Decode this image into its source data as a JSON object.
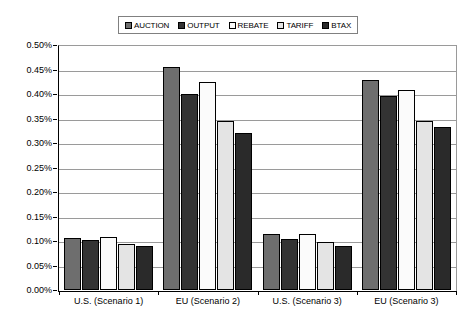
{
  "chart_data": {
    "type": "bar",
    "title": "",
    "xlabel": "",
    "ylabel": "",
    "ylim": [
      0,
      0.5
    ],
    "grid": true,
    "legend_position": "top-center",
    "categories": [
      "U.S. (Scenario 1)",
      "EU (Scenario 2)",
      "U.S. (Scenario 3)",
      "EU (Scenario 3)"
    ],
    "ytick_labels": [
      "0.50%",
      "0.45%",
      "0.40%",
      "0.35%",
      "0.30%",
      "0.25%",
      "0.20%",
      "0.15%",
      "0.10%",
      "0.05%",
      "0.00%"
    ],
    "ytick_values": [
      0.5,
      0.45,
      0.4,
      0.35,
      0.3,
      0.25,
      0.2,
      0.15,
      0.1,
      0.05,
      0.0
    ],
    "series": [
      {
        "name": "AUCTION",
        "color": "#6e6e6e",
        "values": [
          0.107,
          0.455,
          0.115,
          0.428
        ]
      },
      {
        "name": "OUTPUT",
        "color": "#333333",
        "values": [
          0.102,
          0.4,
          0.105,
          0.395
        ]
      },
      {
        "name": "REBATE",
        "color": "#fbfbfb",
        "values": [
          0.108,
          0.425,
          0.115,
          0.408
        ]
      },
      {
        "name": "TARIFF",
        "color": "#e4e4e4",
        "values": [
          0.094,
          0.345,
          0.098,
          0.345
        ]
      },
      {
        "name": "BTAX",
        "color": "#2a2a2a",
        "values": [
          0.089,
          0.32,
          0.09,
          0.333
        ]
      }
    ],
    "legend": [
      {
        "label": "AUCTION",
        "color": "#6e6e6e"
      },
      {
        "label": "OUTPUT",
        "color": "#333333"
      },
      {
        "label": "REBATE",
        "color": "#fbfbfb"
      },
      {
        "label": "TARIFF",
        "color": "#e4e4e4"
      },
      {
        "label": "BTAX",
        "color": "#2a2a2a"
      }
    ]
  }
}
